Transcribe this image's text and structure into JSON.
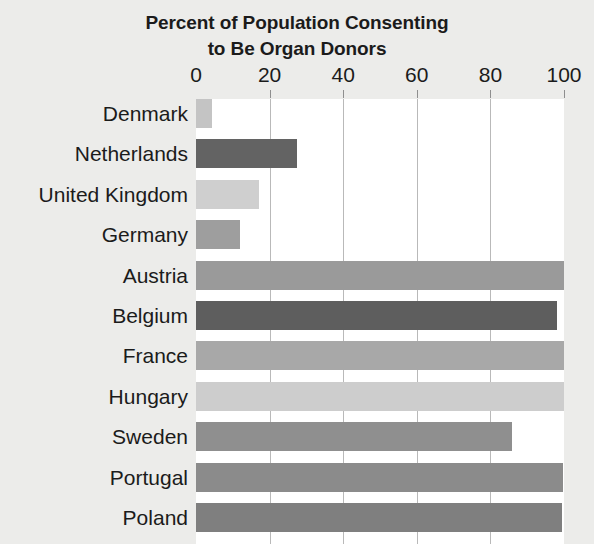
{
  "chart_data": {
    "type": "bar",
    "orientation": "horizontal",
    "title": "Percent of Population Consenting to Be Organ Donors",
    "title_lines": [
      "Percent of Population Consenting",
      "to Be Organ Donors"
    ],
    "xlabel": "",
    "ylabel": "",
    "xlim": [
      0,
      100
    ],
    "xticks": [
      0,
      20,
      40,
      60,
      80,
      100
    ],
    "xticklabels": [
      "0",
      "20",
      "40",
      "60",
      "80",
      "100"
    ],
    "grid": true,
    "grid_axis": "x",
    "legend": false,
    "categories": [
      "Denmark",
      "Netherlands",
      "United Kingdom",
      "Germany",
      "Austria",
      "Belgium",
      "France",
      "Hungary",
      "Sweden",
      "Portugal",
      "Poland"
    ],
    "values": [
      4.3,
      27.5,
      17.2,
      12.0,
      100,
      98,
      99.9,
      99.9,
      85.9,
      99.6,
      99.5
    ],
    "bar_colors": [
      "#c4c4c4",
      "#636363",
      "#cfcfcf",
      "#9e9e9e",
      "#9a9a9a",
      "#5e5e5e",
      "#a8a8a8",
      "#cdcdcd",
      "#8f8f8f",
      "#8b8b8b",
      "#7f7f7f"
    ]
  },
  "style": {
    "page_background": "#ececea",
    "plot_background": "#ffffff",
    "text_color": "#1b1b1b",
    "gridline_color": "#b9b9b9",
    "tick_color": "#8e8e8e"
  }
}
